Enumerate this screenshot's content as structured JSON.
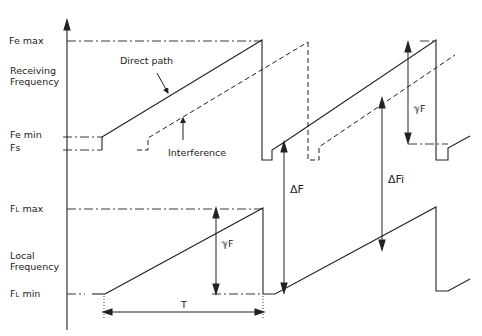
{
  "diagram": {
    "type": "FMCW sawtooth frequency timing diagram",
    "top_panel": {
      "axis_label_line1": "Receiving",
      "axis_label_line2": "Frequency",
      "levels": {
        "fe_max": "Fe max",
        "fe_min": "Fe min",
        "fs": "Fs"
      },
      "annotations": {
        "direct_path": "Direct path",
        "interference": "Interference",
        "delta_f": "ΔF",
        "delta_fi": "ΔFi",
        "gamma_f": "ℽF"
      }
    },
    "bottom_panel": {
      "axis_label_line1": "Local",
      "axis_label_line2": "Frequency",
      "levels": {
        "fl_max_main": "F",
        "fl_max_sub": "L",
        "fl_max_suffix": " max",
        "fl_min_main": "F",
        "fl_min_sub": "L",
        "fl_min_suffix": " min"
      },
      "annotations": {
        "gamma_f": "ℽF",
        "period": "T"
      }
    },
    "colors": {
      "line": "#222222",
      "background": "#ffffff"
    }
  }
}
